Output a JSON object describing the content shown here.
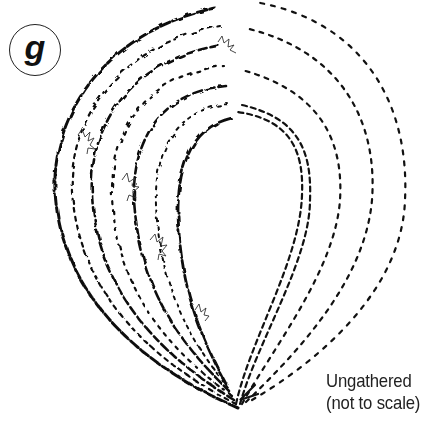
{
  "figure": {
    "label": "g",
    "caption_line1": "Ungathered",
    "caption_line2": "(not to scale)"
  },
  "colors": {
    "ink": "#111111",
    "background": "#ffffff"
  }
}
